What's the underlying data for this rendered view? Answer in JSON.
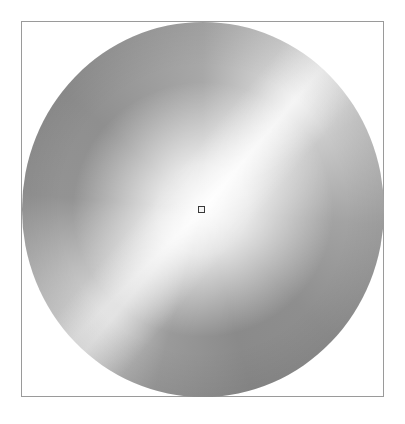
{
  "canvas": {
    "width": 405,
    "height": 424,
    "background": "#ffffff"
  },
  "frame": {
    "border_color": "#9a9a9a"
  },
  "disc": {
    "description": "shaded grayscale circular gradient",
    "center_color": "#ffffff",
    "edge_color_dark": "#8a8a8a",
    "edge_color_light": "#ececec"
  },
  "marker": {
    "shape": "square",
    "x": 201,
    "y": 209,
    "border_color": "#3a3a3a"
  }
}
